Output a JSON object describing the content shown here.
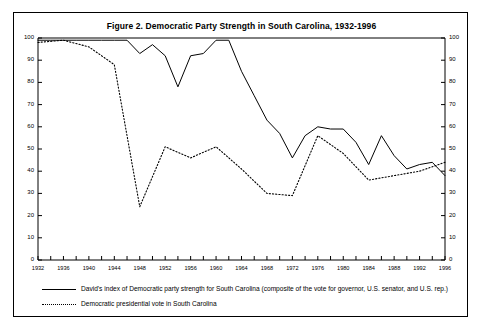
{
  "figure": {
    "title": "Figure 2.  Democratic Party Strength in South Carolina, 1932-1996"
  },
  "legend": {
    "items": [
      {
        "style": "solid",
        "label": "David's index of Democratic party strength for South Carolina (composite of the vote for governor, U.S. senator, and U.S. rep.)"
      },
      {
        "style": "dotted",
        "label": "Democratic presidential vote in South Carolina"
      }
    ]
  },
  "chart_data": {
    "type": "line",
    "title": "Figure 2.  Democratic Party Strength in South Carolina, 1932-1996",
    "xlabel": "",
    "ylabel": "",
    "xlim": [
      1932,
      1996
    ],
    "ylim": [
      0,
      100
    ],
    "grid": false,
    "legend_position": "below-plot",
    "x_tick_interval": 2,
    "x_label_interval": 4,
    "y_tick_interval": 10,
    "dual_y_axis": true,
    "x_tick_labels": [
      "1932",
      "1936",
      "1940",
      "1944",
      "1948",
      "1952",
      "1956",
      "1960",
      "1964",
      "1968",
      "1972",
      "1976",
      "1980",
      "1984",
      "1988",
      "1992",
      "1996"
    ],
    "y_tick_labels": [
      "0",
      "10",
      "20",
      "30",
      "40",
      "50",
      "60",
      "70",
      "80",
      "90",
      "100"
    ],
    "series": [
      {
        "name": "David's index of Democratic party strength for South Carolina (composite of the vote for governor, U.S. senator, and U.S. rep.)",
        "style": "solid",
        "color": "#000000",
        "x": [
          1932,
          1934,
          1936,
          1938,
          1940,
          1942,
          1944,
          1946,
          1948,
          1950,
          1952,
          1954,
          1956,
          1958,
          1960,
          1962,
          1964,
          1966,
          1968,
          1970,
          1972,
          1974,
          1976,
          1978,
          1980,
          1982,
          1984,
          1986,
          1988,
          1990,
          1992,
          1994,
          1996
        ],
        "values": [
          99,
          99,
          99,
          99,
          99,
          99,
          99,
          99,
          93,
          97,
          92,
          78,
          92,
          93,
          99,
          99,
          85,
          74,
          63,
          57,
          46,
          56,
          60,
          59,
          59,
          53,
          43,
          56,
          47,
          41,
          43,
          44,
          38
        ]
      },
      {
        "name": "Democratic presidential vote in South Carolina",
        "style": "dotted",
        "color": "#000000",
        "x": [
          1932,
          1936,
          1940,
          1944,
          1948,
          1952,
          1956,
          1960,
          1964,
          1968,
          1972,
          1976,
          1980,
          1984,
          1988,
          1992,
          1996
        ],
        "values": [
          98,
          99,
          96,
          88,
          24,
          51,
          46,
          51,
          41,
          30,
          29,
          56,
          48,
          36,
          38,
          40,
          44
        ]
      }
    ]
  }
}
